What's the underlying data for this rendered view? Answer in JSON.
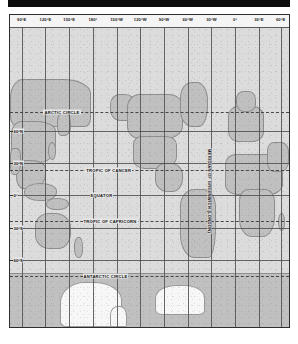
{
  "page": {
    "background_color": "#ffffff",
    "header_bar_color": "#0d0d0d"
  },
  "map": {
    "projection_style": "cylindrical",
    "frame_color": "#2e2e2e",
    "ocean_color": "#dcdcdc",
    "land_color": "#c0c0c0",
    "ice_color": "#f7f7f7",
    "graticule_color": "#4d4d4d",
    "meridian_label": "MERIDIAN OF GREENWICH (LONDON)"
  },
  "chart_data": {
    "type": "map",
    "xlabel": "Longitude",
    "ylabel": "Latitude",
    "xlim": [
      75,
      435
    ],
    "ylim": [
      -90,
      90
    ],
    "grid": true,
    "longitude_labels": [
      {
        "label": "90°E",
        "value": 90,
        "x_pct": 4.2
      },
      {
        "label": "120°E",
        "value": 120,
        "x_pct": 12.7
      },
      {
        "label": "150°E",
        "value": 150,
        "x_pct": 21.2
      },
      {
        "label": "180°",
        "value": 180,
        "x_pct": 29.7
      },
      {
        "label": "150°W",
        "value": 210,
        "x_pct": 38.2
      },
      {
        "label": "120°W",
        "value": 240,
        "x_pct": 46.7
      },
      {
        "label": "90°W",
        "value": 270,
        "x_pct": 55.2
      },
      {
        "label": "60°W",
        "value": 300,
        "x_pct": 63.7
      },
      {
        "label": "30°W",
        "value": 330,
        "x_pct": 72.2
      },
      {
        "label": "0°",
        "value": 360,
        "x_pct": 80.7
      },
      {
        "label": "30°E",
        "value": 30,
        "x_pct": 89.2
      },
      {
        "label": "60°E",
        "value": 60,
        "x_pct": 97.0
      }
    ],
    "latitude_labels": [
      {
        "label": "60°N",
        "value": 60,
        "y_pct": 34.5
      },
      {
        "label": "30°N",
        "value": 30,
        "y_pct": 45.2
      },
      {
        "label": "0°",
        "value": 0,
        "y_pct": 56.0
      },
      {
        "label": "30°S",
        "value": -30,
        "y_pct": 66.8
      },
      {
        "label": "60°S",
        "value": -60,
        "y_pct": 77.5
      }
    ],
    "reference_lines": [
      {
        "label": "ARCTIC CIRCLE",
        "value": 66.5,
        "y_pct": 28.2,
        "style": "dashed",
        "x_pct": 12.0
      },
      {
        "label": "TROPIC OF CANCER",
        "value": 23.5,
        "y_pct": 47.6,
        "style": "dashed",
        "x_pct": 27.0
      },
      {
        "label": "EQUATOR",
        "value": 0,
        "y_pct": 56.0,
        "style": "solid",
        "x_pct": 28.5
      },
      {
        "label": "TROPIC OF CAPRICORN",
        "value": -23.5,
        "y_pct": 64.5,
        "style": "dashed",
        "x_pct": 26.0
      },
      {
        "label": "ANTARCTIC CIRCLE",
        "value": -66.5,
        "y_pct": 83.0,
        "style": "dashed",
        "x_pct": 26.0
      }
    ]
  }
}
